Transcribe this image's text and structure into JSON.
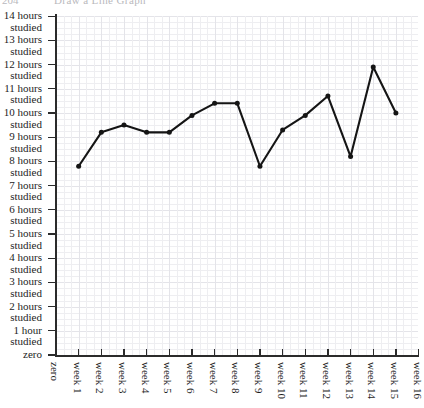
{
  "page_header": {
    "number": "204",
    "title": "Draw a Line Graph"
  },
  "chart_data": {
    "type": "line",
    "title": "",
    "xlabel": "",
    "ylabel": "",
    "categories": [
      "zero",
      "week 1",
      "week 2",
      "week 3",
      "week 4",
      "week 5",
      "week 6",
      "week 7",
      "week 8",
      "week 9",
      "week 10",
      "week 11",
      "week 12",
      "week 13",
      "week 14",
      "week 15",
      "week 16"
    ],
    "x_tick_labels": [
      "zero",
      "week 1",
      "week 2",
      "week 3",
      "week 4",
      "week 5",
      "week 6",
      "week 7",
      "week 8",
      "week 9",
      "week 10",
      "week 11",
      "week 12",
      "week 13",
      "week 14",
      "week 15",
      "week 16"
    ],
    "y_tick_labels": [
      {
        "line1": "14 hours",
        "line2": "studied",
        "value": 14
      },
      {
        "line1": "13 hours",
        "line2": "studied",
        "value": 13
      },
      {
        "line1": "12 hours",
        "line2": "studied",
        "value": 12
      },
      {
        "line1": "11 hours",
        "line2": "studied",
        "value": 11
      },
      {
        "line1": "10 hours",
        "line2": "studied",
        "value": 10
      },
      {
        "line1": "9 hours",
        "line2": "studied",
        "value": 9
      },
      {
        "line1": "8 hours",
        "line2": "studied",
        "value": 8
      },
      {
        "line1": "7 hours",
        "line2": "studied",
        "value": 7
      },
      {
        "line1": "6 hours",
        "line2": "studied",
        "value": 6
      },
      {
        "line1": "5 hours",
        "line2": "studied",
        "value": 5
      },
      {
        "line1": "4 hours",
        "line2": "studied",
        "value": 4
      },
      {
        "line1": "3 hours",
        "line2": "studied",
        "value": 3
      },
      {
        "line1": "2 hours",
        "line2": "studied",
        "value": 2
      },
      {
        "line1": "1 hour",
        "line2": "studied",
        "value": 1
      },
      {
        "line1": "zero",
        "line2": "",
        "value": 0
      }
    ],
    "ylim": [
      0,
      14
    ],
    "xlim": [
      0,
      16
    ],
    "grid": true,
    "legend": false,
    "series": [
      {
        "name": "hours studied",
        "marker": "dot",
        "color": "#151515",
        "points": [
          {
            "x": 1,
            "label": "week 1",
            "y": 7.8
          },
          {
            "x": 2,
            "label": "week 2",
            "y": 9.2
          },
          {
            "x": 3,
            "label": "week 3",
            "y": 9.5
          },
          {
            "x": 4,
            "label": "week 4",
            "y": 9.2
          },
          {
            "x": 5,
            "label": "week 5",
            "y": 9.2
          },
          {
            "x": 6,
            "label": "week 6",
            "y": 9.9
          },
          {
            "x": 7,
            "label": "week 7",
            "y": 10.4
          },
          {
            "x": 8,
            "label": "week 8",
            "y": 10.4
          },
          {
            "x": 9,
            "label": "week 9",
            "y": 7.8
          },
          {
            "x": 10,
            "label": "week 10",
            "y": 9.3
          },
          {
            "x": 11,
            "label": "week 11",
            "y": 9.9
          },
          {
            "x": 12,
            "label": "week 12",
            "y": 10.7
          },
          {
            "x": 13,
            "label": "week 13",
            "y": 8.2
          },
          {
            "x": 14,
            "label": "week 14",
            "y": 11.9
          },
          {
            "x": 15,
            "label": "week 15",
            "y": 10.0
          }
        ]
      }
    ]
  },
  "colors": {
    "line": "#151515",
    "axis": "#2b2b2b",
    "grid_minor": "#eeeef1",
    "grid_major": "#e4e4e9",
    "text": "#1d1d1d",
    "header_text": "#b9b9bd",
    "background": "#ffffff"
  }
}
